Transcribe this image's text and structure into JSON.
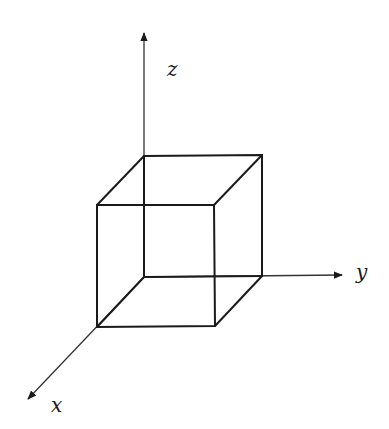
{
  "diagram": {
    "colors": {
      "background": "#ffffff",
      "stroke": "#1a1a1a"
    },
    "axes": {
      "x": {
        "label": "x"
      },
      "y": {
        "label": "y"
      },
      "z": {
        "label": "z"
      }
    },
    "shape": "cube-wireframe"
  }
}
